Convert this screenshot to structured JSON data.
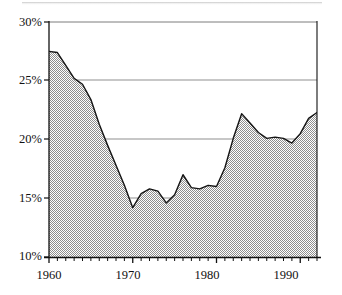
{
  "chart_data": {
    "type": "area",
    "title": "",
    "subtitle": "",
    "xlabel": "",
    "ylabel": "",
    "xlim": [
      1960,
      1992
    ],
    "ylim": [
      10,
      30
    ],
    "yticks": [
      10,
      15,
      20,
      25,
      30
    ],
    "ytick_labels": [
      "10%",
      "15%",
      "20%",
      "25%",
      "30%"
    ],
    "xticks": [
      1960,
      1970,
      1980,
      1990
    ],
    "xtick_labels": [
      "1960",
      "1970",
      "1980",
      "1990"
    ],
    "minor_xticks_every": 1,
    "grid": "horizontal-only",
    "legend": "none",
    "fill_color": "#9d9d9d",
    "line_color": "#1a1a1a",
    "axis_color": "#111111",
    "grid_color": "#8c8c8c",
    "background": "#ffffff",
    "x": [
      1960,
      1961,
      1962,
      1963,
      1964,
      1965,
      1966,
      1967,
      1968,
      1969,
      1970,
      1971,
      1972,
      1973,
      1974,
      1975,
      1976,
      1977,
      1978,
      1979,
      1980,
      1981,
      1982,
      1983,
      1984,
      1985,
      1986,
      1987,
      1988,
      1989,
      1990,
      1991,
      1992
    ],
    "values": [
      27.5,
      27.4,
      26.3,
      25.2,
      24.7,
      23.4,
      21.3,
      19.5,
      17.8,
      16.1,
      14.2,
      15.4,
      15.8,
      15.6,
      14.6,
      15.3,
      17.0,
      15.9,
      15.8,
      16.1,
      16.0,
      17.6,
      20.1,
      22.2,
      21.4,
      20.6,
      20.1,
      20.2,
      20.1,
      19.7,
      20.5,
      21.8,
      22.3
    ],
    "series_name": "",
    "value_unit": "%"
  },
  "axis": {
    "ytick_labels": [
      "30%",
      "25%",
      "20%",
      "15%",
      "10%"
    ],
    "xtick_labels": [
      "1960",
      "1970",
      "1980",
      "1990"
    ]
  }
}
